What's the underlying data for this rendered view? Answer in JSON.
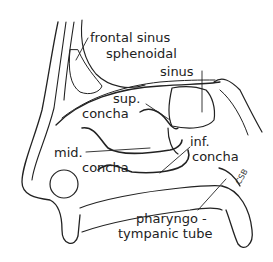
{
  "labels": {
    "frontal_sinus": "frontal sinus",
    "sphenoidal_sinus_line1": "sphenoidal",
    "sphenoidal_sinus_line2": "sinus",
    "sup_concha_line1": "sup.",
    "sup_concha_line2": "concha",
    "mid_concha_line1": "mid.",
    "mid_concha_line2": "concha",
    "inf_concha_line1": "inf.",
    "inf_concha_line2": "concha",
    "pharyngotympanic_line1": "pharyngo -",
    "pharyngotympanic_line2": "tympanic tube"
  },
  "signature": "CSB"
}
